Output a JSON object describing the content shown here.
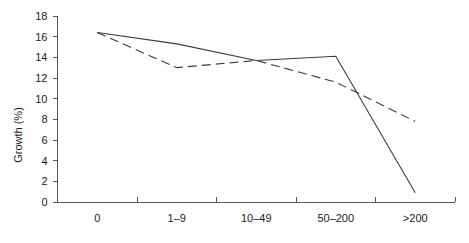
{
  "chart_data": {
    "type": "line",
    "title": "",
    "subtitle": "",
    "xlabel": "",
    "ylabel": "Growth (%)",
    "categories": [
      "0",
      "1–9",
      "10–49",
      "50–200",
      ">200"
    ],
    "xtick_labels": [
      "0",
      "1–9",
      "10–49",
      "50–200",
      ">200"
    ],
    "ytick_labels": [
      "0",
      "2",
      "4",
      "6",
      "8",
      "10",
      "12",
      "14",
      "16",
      "18"
    ],
    "ytick_values": [
      0,
      2,
      4,
      6,
      8,
      10,
      12,
      14,
      16,
      18
    ],
    "ylim": [
      0,
      18
    ],
    "grid": false,
    "legend": "none",
    "series": [
      {
        "name": "solid-series",
        "style": "solid",
        "color": "#3b3b3b",
        "values": [
          16.4,
          15.3,
          13.7,
          14.1,
          0.9
        ]
      },
      {
        "name": "dashed-series",
        "style": "dashed",
        "color": "#3b3b3b",
        "values": [
          16.4,
          13.0,
          13.7,
          11.6,
          7.8
        ]
      }
    ]
  },
  "axes": {
    "y_axis_name": "Growth (%)",
    "x_axis_name": ""
  }
}
